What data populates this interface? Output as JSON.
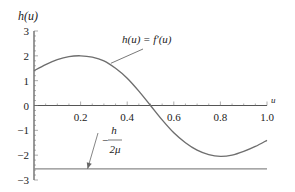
{
  "chart_data": {
    "type": "line",
    "title": "",
    "xlabel": "u",
    "ylabel": "h(u)",
    "xlim": [
      0,
      1.0
    ],
    "ylim": [
      -3,
      3
    ],
    "grid": false,
    "x_ticks": [
      0.2,
      0.4,
      0.6,
      0.8,
      1.0
    ],
    "x_tick_labels": [
      "0.2",
      "0.4",
      "0.6",
      "0.8",
      "1.0"
    ],
    "y_ticks": [
      3,
      2,
      1,
      0,
      -1,
      -2,
      -3
    ],
    "y_tick_labels": [
      "3",
      "2",
      "1",
      "0",
      "−1",
      "−2",
      "−3"
    ],
    "series": [
      {
        "name": "h(u) = f′(u)",
        "x": [
          0,
          0.05,
          0.1,
          0.15,
          0.2,
          0.25,
          0.3,
          0.35,
          0.4,
          0.45,
          0.5,
          0.55,
          0.6,
          0.65,
          0.7,
          0.75,
          0.8,
          0.85,
          0.9,
          0.95,
          1.0
        ],
        "y": [
          1.4,
          1.65,
          1.85,
          1.97,
          2.0,
          1.95,
          1.8,
          1.5,
          1.1,
          0.58,
          0.0,
          -0.58,
          -1.1,
          -1.5,
          -1.8,
          -1.98,
          -2.05,
          -2.0,
          -1.85,
          -1.65,
          -1.4
        ],
        "color": "#6e6e6e"
      },
      {
        "name": "-h/(2μ)",
        "x": [
          0,
          1.0
        ],
        "y": [
          -2.55,
          -2.55
        ],
        "color": "#8a8a8a"
      }
    ],
    "annotations": [
      {
        "text_main": "h(u) = f′(u)",
        "points_to": [
          0.33,
          1.7
        ]
      },
      {
        "text_minus": "−",
        "numerator": "h",
        "denominator": "2μ",
        "points_to": [
          0.23,
          -2.55
        ]
      }
    ]
  }
}
